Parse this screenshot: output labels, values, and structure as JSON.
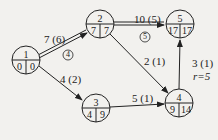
{
  "nodes": [
    {
      "id": "1",
      "es": "0",
      "ls": "0",
      "cx": 26,
      "cy": 60
    },
    {
      "id": "2",
      "es": "7",
      "ls": "7",
      "cx": 100,
      "cy": 24
    },
    {
      "id": "3",
      "es": "4",
      "ls": "9",
      "cx": 96,
      "cy": 108
    },
    {
      "id": "4",
      "es": "9",
      "ls": "14",
      "cx": 179,
      "cy": 103
    },
    {
      "id": "5",
      "es": "17",
      "ls": "17",
      "cx": 180,
      "cy": 24
    }
  ],
  "edges": [
    {
      "from": "1",
      "to": "2",
      "label": "7 (6)",
      "critical": true,
      "marker": "4"
    },
    {
      "from": "1",
      "to": "3",
      "label": "4 (2)",
      "critical": false
    },
    {
      "from": "2",
      "to": "5",
      "label": "10 (5)",
      "critical": true,
      "marker": "5"
    },
    {
      "from": "2",
      "to": "4",
      "label": "2 (1)",
      "critical": false
    },
    {
      "from": "3",
      "to": "4",
      "label": "5 (1)",
      "critical": false
    },
    {
      "from": "4",
      "to": "5",
      "label": "3 (1)",
      "note": "r=5",
      "critical": false
    }
  ]
}
